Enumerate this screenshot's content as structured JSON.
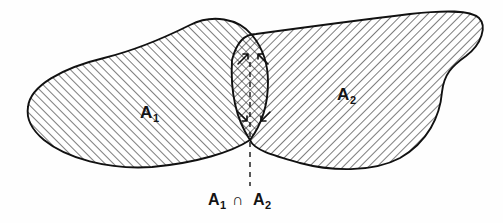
{
  "figure": {
    "background_color": "#fefefe",
    "ink_color": "#111111",
    "width": 503,
    "height": 223
  },
  "labels": {
    "set_one": {
      "base": "A",
      "subscript": "1",
      "full": "A₁",
      "x": 148,
      "y": 112
    },
    "set_two": {
      "base": "A",
      "subscript": "2",
      "full": "A₂",
      "x": 345,
      "y": 95
    }
  },
  "caption": {
    "left_base": "A",
    "left_sub": "1",
    "operator": "∩",
    "right_base": "A",
    "right_sub": "2",
    "full": "A₁ ∩ A₂",
    "x": 213,
    "y": 203
  },
  "leader_line": {
    "name": "dashed-leader",
    "from_x": 250,
    "from_y": 60,
    "to_x": 250,
    "to_y": 186,
    "style": "dashed"
  },
  "regions": [
    {
      "id": "region-a1",
      "label": "A₁",
      "hatch_direction": "forward-slash",
      "hatch_angle_deg": 45,
      "hatch_spacing_px": 6
    },
    {
      "id": "region-a2",
      "label": "A₂",
      "hatch_direction": "back-slash",
      "hatch_angle_deg": -45,
      "hatch_spacing_px": 6
    },
    {
      "id": "region-intersection",
      "label": "A₁ ∩ A₂",
      "hatch_direction": "cross-hatch",
      "hatch_angle_deg": 45,
      "hatch_spacing_px": 6
    }
  ],
  "geometry": {
    "blob_a1_path": "M 28 107 C 30 86, 62 68, 104 58 C 140 49, 168 36, 190 25 C 212 14, 238 18, 252 35 C 262 47, 268 62, 268 82 C 268 104, 262 124, 250 140 C 232 152, 196 163, 152 167 C 108 170, 66 158, 44 140 C 32 130, 26 119, 28 107 Z",
    "blob_a2_path": "M 232 60 C 236 44, 244 34, 256 34 C 300 28, 360 20, 410 14 C 446 10, 470 10, 479 18 C 487 26, 482 44, 466 56 C 452 66, 444 74, 442 92 C 440 116, 428 142, 400 158 C 372 173, 330 171, 300 163 C 272 155, 254 150, 250 140 C 238 122, 230 96, 232 60 Z",
    "cusp_top": {
      "x": 255,
      "y": 35
    },
    "cusp_bottom": {
      "x": 250,
      "y": 140
    },
    "a1_left_tip": {
      "x": 28,
      "y": 107
    },
    "a2_right_tip": {
      "x": 479,
      "y": 18
    }
  },
  "arrows": [
    {
      "name": "intersection-arrow-left",
      "x1": 236,
      "y1": 62,
      "x2": 246,
      "y2": 52
    },
    {
      "name": "intersection-arrow-right",
      "x1": 268,
      "y1": 62,
      "x2": 258,
      "y2": 52
    }
  ]
}
